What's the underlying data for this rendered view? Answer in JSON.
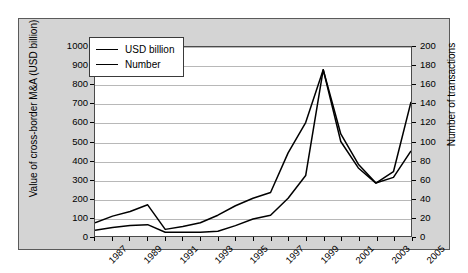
{
  "chart_data": {
    "type": "line",
    "title": "",
    "xlabel": "",
    "ylabel": "Value of cross-border M&A (USD billion)",
    "y2label": "Number of transactions",
    "grid": true,
    "legend_position": "top-left",
    "x": [
      1987,
      1988,
      1989,
      1990,
      1991,
      1992,
      1993,
      1994,
      1995,
      1996,
      1997,
      1998,
      1999,
      2000,
      2001,
      2002,
      2003,
      2004,
      2005
    ],
    "xtick_labels": [
      "1987",
      "1989",
      "1991",
      "1993",
      "1995",
      "1997",
      "1999",
      "2001",
      "2003",
      "2005"
    ],
    "ylim": [
      0,
      1000
    ],
    "ytick_labels": [
      "0",
      "100",
      "200",
      "300",
      "400",
      "500",
      "600",
      "700",
      "800",
      "900",
      "1000"
    ],
    "y2lim": [
      0,
      200
    ],
    "y2tick_labels": [
      "0",
      "20",
      "40",
      "60",
      "80",
      "100",
      "120",
      "140",
      "160",
      "180",
      "200"
    ],
    "series": [
      {
        "name": "USD billion",
        "axis": "left",
        "values": [
          70,
          105,
          130,
          165,
          35,
          50,
          70,
          110,
          160,
          200,
          230,
          440,
          600,
          880,
          540,
          380,
          280,
          340,
          710
        ]
      },
      {
        "name": "Number",
        "axis": "right",
        "values": [
          6,
          9,
          11,
          12,
          4,
          4,
          4,
          5,
          11,
          18,
          22,
          40,
          64,
          176,
          100,
          72,
          56,
          62,
          90
        ]
      }
    ]
  },
  "legend": {
    "items": [
      {
        "label": "USD billion"
      },
      {
        "label": "Number"
      }
    ]
  }
}
